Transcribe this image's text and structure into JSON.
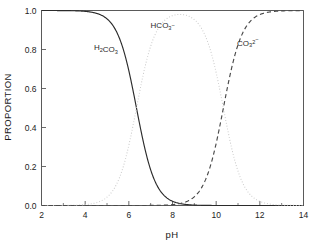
{
  "chart_data": {
    "type": "line",
    "title": "",
    "subtitle": "",
    "xlabel": "pH",
    "ylabel": "PROPORTION",
    "xlim": [
      2,
      14
    ],
    "ylim": [
      0.0,
      1.0
    ],
    "grid": false,
    "legend_position": "inline-annotations",
    "x_ticks": [
      2,
      4,
      6,
      8,
      10,
      12,
      14
    ],
    "x_tick_labels": [
      "2",
      "4",
      "6",
      "8",
      "10",
      "12",
      "14"
    ],
    "x_minor_ticks": [
      3,
      5,
      7,
      9,
      11,
      13
    ],
    "y_ticks": [
      0.0,
      0.2,
      0.4,
      0.6,
      0.8,
      1.0
    ],
    "y_tick_labels": [
      "0.0",
      "0.2",
      "0.4",
      "0.6",
      "0.8",
      "1.0"
    ],
    "pka1": 6.35,
    "pka2": 10.33,
    "x": [
      2.0,
      2.5,
      3.0,
      3.5,
      4.0,
      4.5,
      5.0,
      5.5,
      6.0,
      6.35,
      6.5,
      7.0,
      7.5,
      8.0,
      8.3,
      8.5,
      9.0,
      9.5,
      10.0,
      10.33,
      10.5,
      11.0,
      11.5,
      12.0,
      12.5,
      13.0,
      13.5,
      14.0
    ],
    "series": [
      {
        "name": "H2CO3",
        "label": "H₂CO₃",
        "style": "solid",
        "color": "#2b2b2b",
        "values": [
          1.0,
          1.0,
          0.999,
          0.999,
          0.996,
          0.986,
          0.957,
          0.876,
          0.691,
          0.5,
          0.414,
          0.182,
          0.066,
          0.022,
          0.011,
          0.007,
          0.002,
          0.001,
          0.0,
          0.0,
          0.0,
          0.0,
          0.0,
          0.0,
          0.0,
          0.0,
          0.0,
          0.0
        ]
      },
      {
        "name": "HCO3-",
        "label": "HCO₃⁻",
        "style": "dotted",
        "color": "#c9c9c9",
        "values": [
          0.0,
          0.0,
          0.001,
          0.001,
          0.004,
          0.014,
          0.043,
          0.124,
          0.309,
          0.5,
          0.586,
          0.818,
          0.934,
          0.977,
          0.987,
          0.992,
          0.995,
          0.993,
          0.978,
          0.93,
          0.877,
          0.68,
          0.402,
          0.176,
          0.063,
          0.021,
          0.007,
          0.002
        ]
      },
      {
        "name": "CO3 2-",
        "label": "CO₃²⁻",
        "style": "dashed",
        "color": "#4a4a4a",
        "values": [
          0.0,
          0.0,
          0.0,
          0.0,
          0.0,
          0.0,
          0.0,
          0.0,
          0.0,
          0.0,
          0.0,
          0.0,
          0.0,
          0.001,
          0.002,
          0.001,
          0.005,
          0.015,
          0.045,
          0.07,
          0.123,
          0.32,
          0.598,
          0.824,
          0.937,
          0.979,
          0.993,
          0.998
        ]
      }
    ],
    "annotations": [
      {
        "text": "H₂CO₃",
        "name": "h2co3",
        "x": 4.95,
        "y": 0.795
      },
      {
        "text": "HCO₃⁻",
        "name": "hco3",
        "x": 7.55,
        "y": 0.91
      },
      {
        "text": "CO₃²⁻",
        "name": "co3",
        "x": 11.45,
        "y": 0.82
      }
    ]
  }
}
